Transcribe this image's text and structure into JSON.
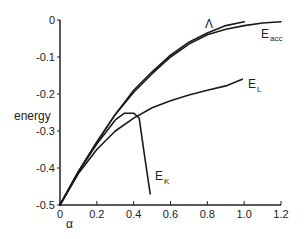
{
  "chart_data": {
    "type": "line",
    "title": "",
    "xlabel": "α",
    "ylabel": "energy",
    "xlim": [
      0,
      1.2
    ],
    "ylim": [
      -0.5,
      0
    ],
    "grid": false,
    "legend": "inline labels at curve ends",
    "x_ticks": [
      "0",
      "0.2",
      "0.4",
      "0.6",
      "0.8",
      "1.0",
      "1.2"
    ],
    "y_ticks": [
      "0",
      "-0.1",
      "-0.2",
      "-0.3",
      "-0.4",
      "-0.5"
    ],
    "series": [
      {
        "name": "Λ",
        "label_main": "Λ",
        "label_sub": "",
        "x": [
          0,
          0.1,
          0.2,
          0.3,
          0.4,
          0.5,
          0.6,
          0.7,
          0.8,
          0.9,
          1.0
        ],
        "values": [
          -0.5,
          -0.41,
          -0.33,
          -0.255,
          -0.19,
          -0.14,
          -0.095,
          -0.06,
          -0.035,
          -0.015,
          -0.005
        ]
      },
      {
        "name": "E_acc",
        "label_main": "E",
        "label_sub": "acc",
        "x": [
          0,
          0.1,
          0.2,
          0.3,
          0.4,
          0.5,
          0.6,
          0.7,
          0.8,
          0.9,
          1.0,
          1.1,
          1.2
        ],
        "values": [
          -0.5,
          -0.41,
          -0.33,
          -0.255,
          -0.195,
          -0.145,
          -0.1,
          -0.065,
          -0.04,
          -0.025,
          -0.015,
          -0.008,
          -0.005
        ]
      },
      {
        "name": "E_L",
        "label_main": "E",
        "label_sub": "L",
        "x": [
          0,
          0.1,
          0.2,
          0.3,
          0.4,
          0.5,
          0.6,
          0.7,
          0.8,
          0.9,
          0.99
        ],
        "values": [
          -0.5,
          -0.415,
          -0.35,
          -0.3,
          -0.265,
          -0.237,
          -0.218,
          -0.203,
          -0.19,
          -0.178,
          -0.16
        ]
      },
      {
        "name": "E_K",
        "label_main": "E",
        "label_sub": "K",
        "x": [
          0,
          0.1,
          0.2,
          0.3,
          0.35,
          0.4,
          0.43,
          0.46,
          0.49
        ],
        "values": [
          -0.5,
          -0.41,
          -0.335,
          -0.27,
          -0.252,
          -0.252,
          -0.265,
          -0.37,
          -0.47
        ]
      }
    ]
  }
}
